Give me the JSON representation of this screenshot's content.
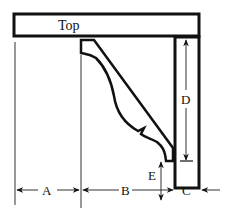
{
  "diagram": {
    "labels": {
      "top": "Top",
      "a": "A",
      "b": "B",
      "c": "C",
      "d": "D",
      "e": "E"
    },
    "colors": {
      "stroke": "#111111",
      "dim_line": "#555555",
      "background": "#ffffff"
    }
  }
}
